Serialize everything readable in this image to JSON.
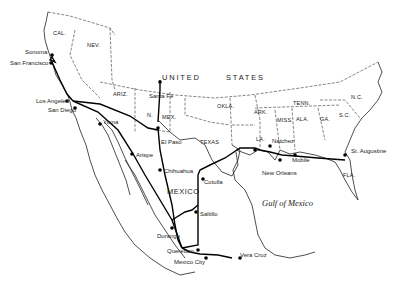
{
  "map": {
    "title_region": "UNITED STATES",
    "country_labels": {
      "us_left": "UNITED",
      "us_right": "STATES",
      "mexico": "MEXICO"
    },
    "water_labels": {
      "gulf": "Gulf of Mexico"
    },
    "states": {
      "cal": "CAL.",
      "nev": "NEV.",
      "ariz": "ARIZ.",
      "n": "N.",
      "mex": "MEX.",
      "texas": "TEXAS",
      "okla": "OKLA.",
      "ark": "ARK.",
      "la": "LA.",
      "miss": "MISS.",
      "ala": "ALA.",
      "ga": "GA.",
      "tenn": "TENN.",
      "sc": "S.C.",
      "nc": "N.C.",
      "fla": "FLA."
    },
    "cities": {
      "sonoma": "Sonoma",
      "san_francisco": "San Francisco",
      "los_angeles": "Los Angeles",
      "san_diego": "San Diego",
      "yuma": "Yuma",
      "santa_fe": "Santa Fe",
      "el_paso": "El Paso",
      "arispe": "Arispe",
      "chihuahua": "Chihuahua",
      "cotulla": "Cotulla",
      "saltillo": "Saltillo",
      "durango": "Durango",
      "queretaro": "Queretaro",
      "mexico_city": "Mexico City",
      "vera_cruz": "Vera Cruz",
      "natchez": "Natchez",
      "new_orleans": "New Orleans",
      "mobile": "Mobile",
      "st_augustine": "St. Augustine"
    },
    "colors": {
      "ink": "#111111",
      "background": "#ffffff"
    }
  }
}
